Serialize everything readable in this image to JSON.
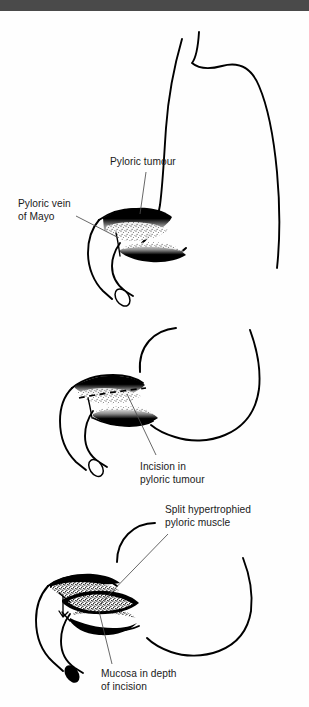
{
  "page": {
    "background_color": "#fefefe",
    "topbar_color": "#4a4a4a",
    "ink_color": "#000000",
    "leader_color": "#4d4d4d"
  },
  "figure": {
    "panel_count": 3,
    "style": "black-and-white line drawing with stippled shading"
  },
  "panels": [
    {
      "id": "panel-1",
      "name": "pyloric-tumour-identified",
      "labels": [
        {
          "id": "label-pyloric-tumour",
          "name": "pyloric-tumour-label",
          "lines": [
            "Pyloric tumour"
          ]
        },
        {
          "id": "label-pyloric-vein",
          "name": "pyloric-vein-of-mayo-label",
          "lines": [
            "Pyloric vein",
            "of Mayo"
          ]
        }
      ]
    },
    {
      "id": "panel-2",
      "name": "incision-marked",
      "labels": [
        {
          "id": "label-incision",
          "name": "incision-in-pyloric-tumour-label",
          "lines": [
            "Incision in",
            "pyloric tumour"
          ]
        }
      ]
    },
    {
      "id": "panel-3",
      "name": "muscle-split-open",
      "labels": [
        {
          "id": "label-split-muscle",
          "name": "split-hypertrophied-pyloric-muscle-label",
          "lines": [
            "Split hypertrophied",
            "pyloric muscle"
          ]
        },
        {
          "id": "label-mucosa",
          "name": "mucosa-in-depth-of-incision-label",
          "lines": [
            "Mucosa in depth",
            "of incision"
          ]
        }
      ]
    }
  ],
  "text": {
    "pyloric_tumour_l1": "Pyloric tumour",
    "pyloric_vein_l1": "Pyloric vein",
    "pyloric_vein_l2": "of Mayo",
    "incision_l1": "Incision in",
    "incision_l2": "pyloric tumour",
    "split_muscle_l1": "Split hypertrophied",
    "split_muscle_l2": "pyloric muscle",
    "mucosa_l1": "Mucosa in depth",
    "mucosa_l2": "of incision"
  }
}
